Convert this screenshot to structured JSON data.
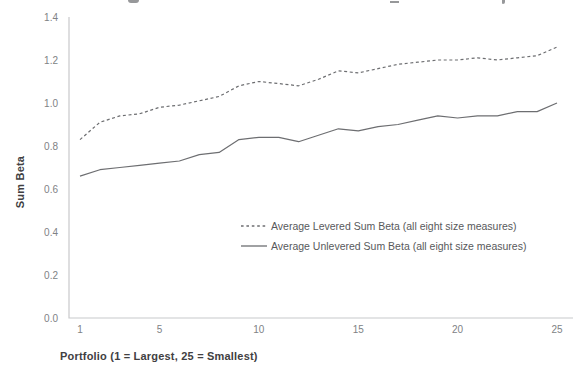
{
  "chart_data": {
    "type": "line",
    "title": "",
    "xlabel": "Portfolio (1 = Largest, 25 = Smallest)",
    "ylabel": "Sum Beta",
    "x": [
      1,
      2,
      3,
      4,
      5,
      6,
      7,
      8,
      9,
      10,
      11,
      12,
      13,
      14,
      15,
      16,
      17,
      18,
      19,
      20,
      21,
      22,
      23,
      24,
      25
    ],
    "x_tick_labels": [
      "1",
      "5",
      "10",
      "15",
      "20",
      "25"
    ],
    "x_tick_values": [
      1,
      5,
      10,
      15,
      20,
      25
    ],
    "y_tick_labels": [
      "0.0",
      "0.2",
      "0.4",
      "0.6",
      "0.8",
      "1.0",
      "1.2",
      "1.4"
    ],
    "y_tick_values": [
      0.0,
      0.2,
      0.4,
      0.6,
      0.8,
      1.0,
      1.2,
      1.4
    ],
    "xlim": [
      1,
      25
    ],
    "ylim": [
      0,
      1.4
    ],
    "grid": false,
    "legend_position": "inside-right-middle",
    "series": [
      {
        "name": "Average Levered Sum Beta (all eight size measures)",
        "style": "dashed",
        "color": "#6d6e71",
        "values": [
          0.83,
          0.91,
          0.94,
          0.95,
          0.98,
          0.99,
          1.01,
          1.03,
          1.08,
          1.1,
          1.09,
          1.08,
          1.11,
          1.15,
          1.14,
          1.16,
          1.18,
          1.19,
          1.2,
          1.2,
          1.21,
          1.2,
          1.21,
          1.22,
          1.26
        ]
      },
      {
        "name": "Average Unlevered Sum Beta (all eight size measures)",
        "style": "solid",
        "color": "#6d6e71",
        "values": [
          0.66,
          0.69,
          0.7,
          0.71,
          0.72,
          0.73,
          0.76,
          0.77,
          0.83,
          0.84,
          0.84,
          0.82,
          0.85,
          0.88,
          0.87,
          0.89,
          0.9,
          0.92,
          0.94,
          0.93,
          0.94,
          0.94,
          0.96,
          0.96,
          1.0
        ]
      }
    ]
  },
  "colors": {
    "background": "#ffffff",
    "axis_line": "#c8c9cb",
    "tick_label": "#808285",
    "axis_title": "#414042",
    "series_line": "#6d6e71",
    "legend_text": "#58595b"
  }
}
